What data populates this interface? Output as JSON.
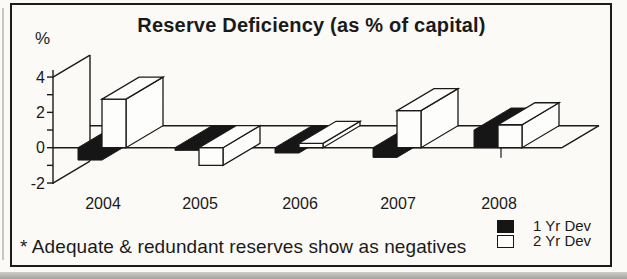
{
  "colors": {
    "ink": "#1a1a1a",
    "paper": "#fbfaf7",
    "bar_black": "#161616",
    "bar_white": "#fdfdfb"
  },
  "chart_data": {
    "type": "bar",
    "style": "3d-oblique-clustered",
    "title": "Reserve Deficiency (as % of capital)",
    "y_axis_label": "%",
    "categories": [
      "2004",
      "2005",
      "2006",
      "2007",
      "2008"
    ],
    "series": [
      {
        "name": "1 Yr Dev",
        "color": "#161616",
        "values": [
          -0.7,
          -0.15,
          -0.3,
          -0.55,
          1.0
        ]
      },
      {
        "name": "2 Yr Dev",
        "color": "#fdfdfb",
        "values": [
          2.75,
          -1.0,
          0.25,
          2.1,
          1.3
        ]
      }
    ],
    "ylim": [
      -2,
      4.3
    ],
    "yticks": [
      {
        "value": 4,
        "label": "4"
      },
      {
        "value": 3,
        "label": ""
      },
      {
        "value": 2,
        "label": "2"
      },
      {
        "value": 1,
        "label": ""
      },
      {
        "value": 0,
        "label": "0"
      },
      {
        "value": -1,
        "label": ""
      },
      {
        "value": -2,
        "label": "-2"
      }
    ],
    "grid": false,
    "legend_position": "bottom-right",
    "footnote": "* Adequate & redundant reserves show as negatives"
  }
}
